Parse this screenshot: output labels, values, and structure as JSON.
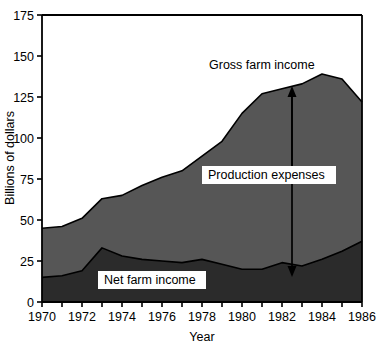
{
  "chart_data": {
    "type": "area",
    "title": "",
    "xlabel": "Year",
    "ylabel": "Billions of dollars",
    "xlim": [
      1970,
      1986
    ],
    "ylim": [
      0,
      175
    ],
    "yticks": [
      0,
      25,
      50,
      75,
      100,
      125,
      150,
      175
    ],
    "ytick_labels": [
      "0",
      "25",
      "50",
      "75",
      "100",
      "125",
      "150",
      "175"
    ],
    "xticks": [
      1970,
      1971,
      1972,
      1973,
      1974,
      1975,
      1976,
      1977,
      1978,
      1979,
      1980,
      1981,
      1982,
      1983,
      1984,
      1985,
      1986
    ],
    "xtick_labels": [
      "1970",
      "",
      "1972",
      "",
      "1974",
      "",
      "1976",
      "",
      "1978",
      "",
      "1980",
      "",
      "1982",
      "",
      "1984",
      "",
      "1986"
    ],
    "grid": false,
    "legend_position": "none",
    "x": [
      1970,
      1971,
      1972,
      1973,
      1974,
      1975,
      1976,
      1977,
      1978,
      1979,
      1980,
      1981,
      1982,
      1983,
      1984,
      1985,
      1986
    ],
    "series": [
      {
        "name": "Gross farm income",
        "fill_color": "#565656",
        "values": [
          45,
          46,
          51,
          63,
          65,
          71,
          76,
          80,
          89,
          98,
          115,
          127,
          130,
          133,
          139,
          136,
          122
        ]
      },
      {
        "name": "Net farm income",
        "fill_color": "#2b2b2b",
        "values": [
          15,
          16,
          19,
          33,
          28,
          26,
          25,
          24,
          26,
          23,
          20,
          20,
          24,
          22,
          26,
          31,
          37
        ]
      }
    ],
    "annotations": [
      {
        "name": "gross-farm-income",
        "text": "Gross farm income",
        "x": 1982,
        "y": 158,
        "arrow": "up-to-gross-curve"
      },
      {
        "name": "production-expenses",
        "text": "Production expenses",
        "x": 1982,
        "y": 80,
        "arrow": "double-headed-vertical"
      },
      {
        "name": "net-farm-income",
        "text": "Net farm income",
        "x": 1976,
        "y": 12,
        "arrow": "none"
      }
    ]
  }
}
